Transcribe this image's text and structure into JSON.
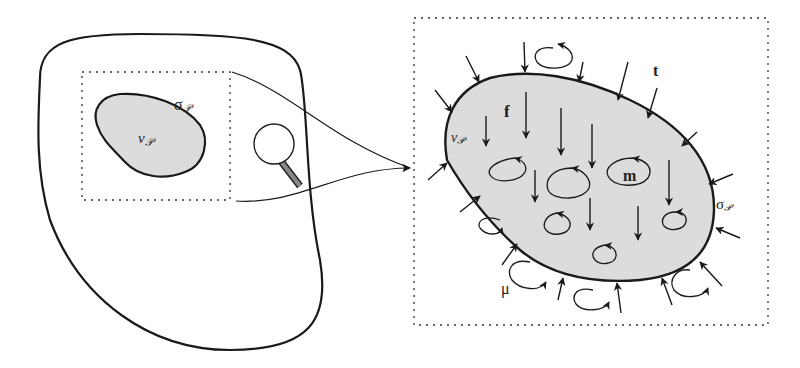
{
  "figure": {
    "type": "continuum-body-diagram",
    "background": "#ffffff",
    "stroke_color": "#1a1a1a",
    "fill_color": "#dcdcdc"
  },
  "left_panel": {
    "body_outline": "large-body",
    "subregion_label_volume": "v",
    "subregion_label_volume_sub": "𝒫",
    "subregion_label_surface": "σ",
    "subregion_label_surface_sub": "𝒫",
    "magnifier": "magnifying-glass-icon"
  },
  "right_panel": {
    "label_volume": "v",
    "label_volume_sub": "𝒫",
    "label_surface": "σ",
    "label_surface_sub": "𝒫",
    "label_traction": "t",
    "label_body_force": "f",
    "label_body_couple": "m",
    "label_surface_couple": "μ"
  }
}
